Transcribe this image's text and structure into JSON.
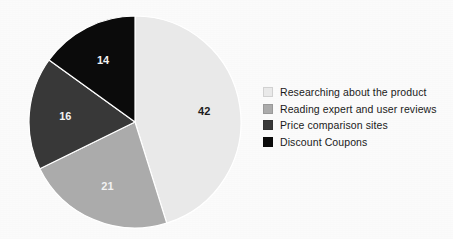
{
  "chart_data": {
    "type": "pie",
    "title": "",
    "subtitle": "",
    "xlabel": "",
    "ylabel": "",
    "total": 93,
    "start_angle_deg": 0,
    "direction": "clockwise",
    "grid": false,
    "legend_position": "right",
    "categories": [
      "Researching about the product",
      "Reading expert and user reviews",
      "Price comparison sites",
      "Discount Coupons"
    ],
    "values": [
      42,
      21,
      16,
      14
    ],
    "labels": [
      "42",
      "21",
      "16",
      "14"
    ],
    "colors": [
      "#e9e9e9",
      "#ababab",
      "#383838",
      "#0b0b0b"
    ],
    "label_colors": [
      "#1c1c1c",
      "#f2f2f2",
      "#f2f2f2",
      "#f2f2f2"
    ],
    "slice_separator_color": "#ffffff"
  },
  "legend": {
    "items": [
      {
        "label": "Researching about the product",
        "color": "#e9e9e9",
        "value": 42
      },
      {
        "label": "Reading expert and user reviews",
        "color": "#ababab",
        "value": 21
      },
      {
        "label": "Price comparison sites",
        "color": "#383838",
        "value": 16
      },
      {
        "label": "Discount Coupons",
        "color": "#0b0b0b",
        "value": 14
      }
    ]
  },
  "pie_geometry": {
    "center_x": 107,
    "center_y": 107,
    "radius": 106
  }
}
